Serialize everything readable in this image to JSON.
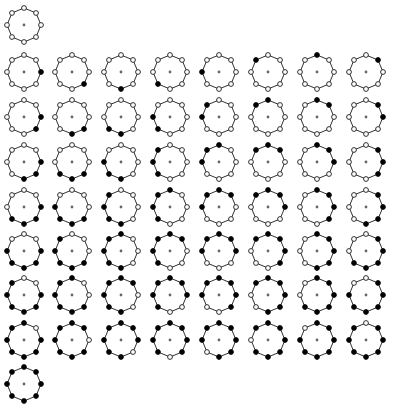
{
  "figure": {
    "canvas": {
      "width": 403,
      "height": 410,
      "background": "#ffffff"
    }
  },
  "style": {
    "ring_stroke": "#1a1a1a",
    "bead_open_fill": "#ffffff",
    "bead_filled_fill": "#000000",
    "hub_fill": "#666666",
    "ring_radius": 17,
    "bead_radius": 2.4,
    "hub_radius": 1.4,
    "beads_per_circle": 8,
    "start_angle_deg": 0,
    "rotation_direction": "clockwise"
  },
  "grid": {
    "columns": 8,
    "rows": 9,
    "cell_width": 48.5,
    "cell_height": 44,
    "origin_x": 24,
    "origin_y": 25,
    "row_y": [
      25,
      72,
      117,
      162,
      207,
      251,
      295,
      340,
      384
    ],
    "column_x": [
      24,
      72,
      121,
      170,
      219,
      268,
      317,
      366
    ]
  },
  "rows": [
    {
      "index": 0,
      "label": "0 filled",
      "filled_count": 0,
      "circle_count": 1,
      "circles": [
        {
          "label": "rotation 0",
          "beads": [
            0,
            0,
            0,
            0,
            0,
            0,
            0,
            0
          ]
        }
      ]
    },
    {
      "index": 1,
      "label": "1 filled",
      "filled_count": 1,
      "circle_count": 8,
      "circles": [
        {
          "label": "rotation 0",
          "beads": [
            1,
            0,
            0,
            0,
            0,
            0,
            0,
            0
          ]
        },
        {
          "label": "rotation 1",
          "beads": [
            0,
            1,
            0,
            0,
            0,
            0,
            0,
            0
          ]
        },
        {
          "label": "rotation 2",
          "beads": [
            0,
            0,
            1,
            0,
            0,
            0,
            0,
            0
          ]
        },
        {
          "label": "rotation 3",
          "beads": [
            0,
            0,
            0,
            1,
            0,
            0,
            0,
            0
          ]
        },
        {
          "label": "rotation 4",
          "beads": [
            0,
            0,
            0,
            0,
            1,
            0,
            0,
            0
          ]
        },
        {
          "label": "rotation 5",
          "beads": [
            0,
            0,
            0,
            0,
            0,
            1,
            0,
            0
          ]
        },
        {
          "label": "rotation 6",
          "beads": [
            0,
            0,
            0,
            0,
            0,
            0,
            1,
            0
          ]
        },
        {
          "label": "rotation 7",
          "beads": [
            0,
            0,
            0,
            0,
            0,
            0,
            0,
            1
          ]
        }
      ]
    },
    {
      "index": 2,
      "label": "2 filled",
      "filled_count": 2,
      "circle_count": 8,
      "circles": [
        {
          "label": "rotation 0",
          "beads": [
            1,
            1,
            0,
            0,
            0,
            0,
            0,
            0
          ]
        },
        {
          "label": "rotation 1",
          "beads": [
            0,
            1,
            1,
            0,
            0,
            0,
            0,
            0
          ]
        },
        {
          "label": "rotation 2",
          "beads": [
            0,
            0,
            1,
            1,
            0,
            0,
            0,
            0
          ]
        },
        {
          "label": "rotation 3",
          "beads": [
            0,
            0,
            0,
            1,
            1,
            0,
            0,
            0
          ]
        },
        {
          "label": "rotation 4",
          "beads": [
            0,
            0,
            0,
            0,
            1,
            1,
            0,
            0
          ]
        },
        {
          "label": "rotation 5",
          "beads": [
            0,
            0,
            0,
            0,
            0,
            1,
            1,
            0
          ]
        },
        {
          "label": "rotation 6",
          "beads": [
            0,
            0,
            0,
            0,
            0,
            0,
            1,
            1
          ]
        },
        {
          "label": "rotation 7",
          "beads": [
            1,
            0,
            0,
            0,
            0,
            0,
            0,
            1
          ]
        }
      ]
    },
    {
      "index": 3,
      "label": "3 filled",
      "filled_count": 3,
      "circle_count": 8,
      "circles": [
        {
          "label": "rotation 0",
          "beads": [
            1,
            1,
            1,
            0,
            0,
            0,
            0,
            0
          ]
        },
        {
          "label": "rotation 1",
          "beads": [
            0,
            1,
            1,
            1,
            0,
            0,
            0,
            0
          ]
        },
        {
          "label": "rotation 2",
          "beads": [
            0,
            0,
            1,
            1,
            1,
            0,
            0,
            0
          ]
        },
        {
          "label": "rotation 3",
          "beads": [
            0,
            0,
            0,
            1,
            1,
            1,
            0,
            0
          ]
        },
        {
          "label": "rotation 4",
          "beads": [
            0,
            0,
            0,
            0,
            1,
            1,
            1,
            0
          ]
        },
        {
          "label": "rotation 5",
          "beads": [
            0,
            0,
            0,
            0,
            0,
            1,
            1,
            1
          ]
        },
        {
          "label": "rotation 6",
          "beads": [
            1,
            0,
            0,
            0,
            0,
            0,
            1,
            1
          ]
        },
        {
          "label": "rotation 7",
          "beads": [
            1,
            1,
            0,
            0,
            0,
            0,
            0,
            1
          ]
        }
      ]
    },
    {
      "index": 4,
      "label": "4 filled",
      "filled_count": 4,
      "circle_count": 8,
      "circles": [
        {
          "label": "rotation 0",
          "beads": [
            1,
            1,
            1,
            1,
            0,
            0,
            0,
            0
          ]
        },
        {
          "label": "rotation 1",
          "beads": [
            0,
            1,
            1,
            1,
            1,
            0,
            0,
            0
          ]
        },
        {
          "label": "rotation 2",
          "beads": [
            0,
            0,
            1,
            1,
            1,
            1,
            0,
            0
          ]
        },
        {
          "label": "rotation 3",
          "beads": [
            0,
            0,
            0,
            1,
            1,
            1,
            1,
            0
          ]
        },
        {
          "label": "rotation 4",
          "beads": [
            0,
            0,
            0,
            0,
            1,
            1,
            1,
            1
          ]
        },
        {
          "label": "rotation 5",
          "beads": [
            1,
            0,
            0,
            0,
            0,
            1,
            1,
            1
          ]
        },
        {
          "label": "rotation 6",
          "beads": [
            1,
            1,
            0,
            0,
            0,
            0,
            1,
            1
          ]
        },
        {
          "label": "rotation 7",
          "beads": [
            1,
            1,
            1,
            0,
            0,
            0,
            0,
            1
          ]
        }
      ]
    },
    {
      "index": 5,
      "label": "5 filled",
      "filled_count": 5,
      "circle_count": 8,
      "circles": [
        {
          "label": "rotation 0",
          "beads": [
            1,
            1,
            1,
            1,
            1,
            0,
            0,
            0
          ]
        },
        {
          "label": "rotation 1",
          "beads": [
            0,
            1,
            1,
            1,
            1,
            1,
            0,
            0
          ]
        },
        {
          "label": "rotation 2",
          "beads": [
            0,
            0,
            1,
            1,
            1,
            1,
            1,
            0
          ]
        },
        {
          "label": "rotation 3",
          "beads": [
            0,
            0,
            0,
            1,
            1,
            1,
            1,
            1
          ]
        },
        {
          "label": "rotation 4",
          "beads": [
            1,
            0,
            0,
            0,
            1,
            1,
            1,
            1
          ]
        },
        {
          "label": "rotation 5",
          "beads": [
            1,
            1,
            0,
            0,
            0,
            1,
            1,
            1
          ]
        },
        {
          "label": "rotation 6",
          "beads": [
            1,
            1,
            1,
            0,
            0,
            0,
            1,
            1
          ]
        },
        {
          "label": "rotation 7",
          "beads": [
            1,
            1,
            1,
            1,
            0,
            0,
            0,
            1
          ]
        }
      ]
    },
    {
      "index": 6,
      "label": "6 filled",
      "filled_count": 6,
      "circle_count": 8,
      "circles": [
        {
          "label": "rotation 0",
          "beads": [
            1,
            1,
            1,
            1,
            1,
            1,
            0,
            0
          ]
        },
        {
          "label": "rotation 1",
          "beads": [
            0,
            1,
            1,
            1,
            1,
            1,
            1,
            0
          ]
        },
        {
          "label": "rotation 2",
          "beads": [
            0,
            0,
            1,
            1,
            1,
            1,
            1,
            1
          ]
        },
        {
          "label": "rotation 3",
          "beads": [
            1,
            0,
            0,
            1,
            1,
            1,
            1,
            1
          ]
        },
        {
          "label": "rotation 4",
          "beads": [
            1,
            1,
            0,
            0,
            1,
            1,
            1,
            1
          ]
        },
        {
          "label": "rotation 5",
          "beads": [
            1,
            1,
            1,
            0,
            0,
            1,
            1,
            1
          ]
        },
        {
          "label": "rotation 6",
          "beads": [
            1,
            1,
            1,
            1,
            0,
            0,
            1,
            1
          ]
        },
        {
          "label": "rotation 7",
          "beads": [
            1,
            1,
            1,
            1,
            1,
            0,
            0,
            1
          ]
        }
      ]
    },
    {
      "index": 7,
      "label": "7 filled",
      "filled_count": 7,
      "circle_count": 8,
      "circles": [
        {
          "label": "rotation 0",
          "beads": [
            1,
            1,
            1,
            1,
            1,
            1,
            1,
            0
          ]
        },
        {
          "label": "rotation 1",
          "beads": [
            0,
            1,
            1,
            1,
            1,
            1,
            1,
            1
          ]
        },
        {
          "label": "rotation 2",
          "beads": [
            1,
            0,
            1,
            1,
            1,
            1,
            1,
            1
          ]
        },
        {
          "label": "rotation 3",
          "beads": [
            1,
            1,
            0,
            1,
            1,
            1,
            1,
            1
          ]
        },
        {
          "label": "rotation 4",
          "beads": [
            1,
            1,
            1,
            0,
            1,
            1,
            1,
            1
          ]
        },
        {
          "label": "rotation 5",
          "beads": [
            1,
            1,
            1,
            1,
            0,
            1,
            1,
            1
          ]
        },
        {
          "label": "rotation 6",
          "beads": [
            1,
            1,
            1,
            1,
            1,
            0,
            1,
            1
          ]
        },
        {
          "label": "rotation 7",
          "beads": [
            1,
            1,
            1,
            1,
            1,
            1,
            0,
            1
          ]
        }
      ]
    },
    {
      "index": 8,
      "label": "8 filled",
      "filled_count": 8,
      "circle_count": 1,
      "circles": [
        {
          "label": "rotation 0",
          "beads": [
            1,
            1,
            1,
            1,
            1,
            1,
            1,
            1
          ]
        }
      ]
    }
  ]
}
